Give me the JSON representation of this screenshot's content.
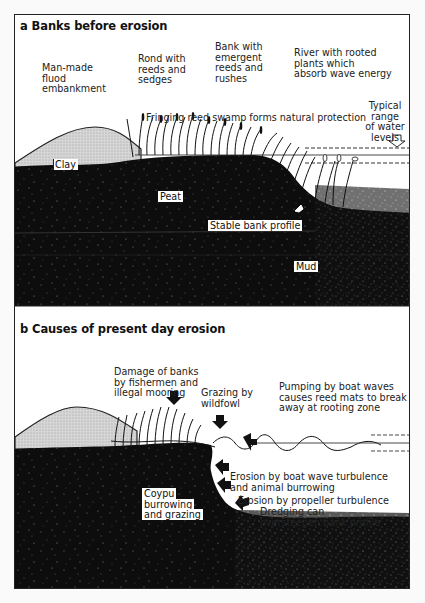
{
  "figure": {
    "panel_a": {
      "title": "a Banks before erosion",
      "labels": {
        "embankment": [
          "Man-made",
          "fluod",
          "embankment"
        ],
        "rond": [
          "Rond with",
          "reeds and",
          "sedges"
        ],
        "bank": [
          "Bank with",
          "emergent",
          "reeds and",
          "rushes"
        ],
        "river": [
          "River with rooted",
          "plants which",
          "absorb wave energy"
        ],
        "water_levels": [
          "Typical",
          "range",
          "of water",
          "levels"
        ],
        "fringing": "Fringing reed swamp forms natural protection",
        "clay": "Clay",
        "peat": "Peat",
        "stable": "Stable bank profile",
        "mud": "Mud"
      }
    },
    "panel_b": {
      "title": "b Causes of present day erosion",
      "labels": {
        "damage": [
          "Damage of banks",
          "by fishermen and",
          "illegal mooring"
        ],
        "grazing_wildfowl": [
          "Grazing by",
          "wildfowl"
        ],
        "pumping": [
          "Pumping by boat waves",
          "causes reed mats to break",
          "away at rooting zone"
        ],
        "erosion_boat": [
          "Erosion by boat wave turbulence",
          "and animal burrowing"
        ],
        "erosion_propeller": "Erosion by propeller turbulence",
        "dredging": [
          "Dredging can",
          "oversteepen bank profile"
        ],
        "coypu": [
          "Coypu",
          "burrowing",
          "and grazing"
        ]
      }
    },
    "colors": {
      "ink": "#111111",
      "clay_fill": "#cfcfcf",
      "mud_fill": "#0d0d0d",
      "paper": "#ffffff"
    }
  }
}
